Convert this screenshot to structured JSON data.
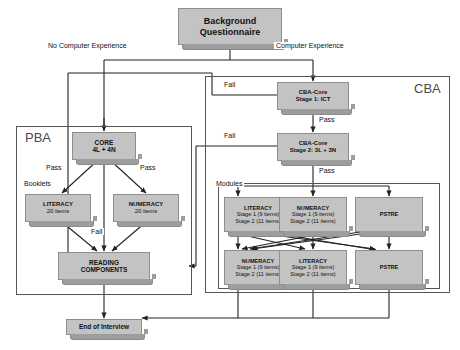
{
  "diagram": {
    "colors": {
      "node_fill": "#c3c3c3",
      "node_shadow": "#9d9d9d",
      "node_border": "#8e8e8e",
      "frame_border": "#555555",
      "line": "#222222",
      "text": "#111111",
      "frame_label_text": "#4a4a4a",
      "background": "#ffffff"
    },
    "frames": [
      {
        "id": "pba",
        "label": "PBA"
      },
      {
        "id": "cba",
        "label": "CBA"
      },
      {
        "id": "modules",
        "label": ""
      }
    ],
    "nodes": {
      "background_questionnaire": {
        "line1": "Background",
        "line2": "Questionnaire"
      },
      "cba_core_stage1": {
        "line1": "CBA-Core",
        "line2": "Stage 1: ICT"
      },
      "cba_core_stage2": {
        "line1": "CBA-Core",
        "line2": "Stage 2: 3L + 3N"
      },
      "pba_core": {
        "line1": "CORE",
        "line2": "4L + 4N"
      },
      "pba_literacy": {
        "line1": "LITERACY",
        "line2": "20 items"
      },
      "pba_numeracy": {
        "line1": "NUMERACY",
        "line2": "20 items"
      },
      "reading_components": {
        "line1": "READING",
        "line2": "COMPONENTS"
      },
      "mod_r1_literacy": {
        "line1": "LITERACY",
        "line2": "Stage 1 (9 items)",
        "line3": "Stage 2 (11 items)"
      },
      "mod_r1_numeracy": {
        "line1": "NUMERACY",
        "line2": "Stage 1 (9 items)",
        "line3": "Stage 2 (11 items)"
      },
      "mod_r1_pstre": {
        "line1": "PSTRE",
        "line2": "",
        "line3": ""
      },
      "mod_r2_numeracy": {
        "line1": "NUMERACY",
        "line2": "Stage 1 (9 items)",
        "line3": "Stage 2 (11 items)"
      },
      "mod_r2_literacy": {
        "line1": "LITERACY",
        "line2": "Stage 1 (9 items)",
        "line3": "Stage 2 (11 items)"
      },
      "mod_r2_pstre": {
        "line1": "PSTRE",
        "line2": "",
        "line3": ""
      },
      "end_of_interview": {
        "line1": "End of Interview"
      }
    },
    "edge_labels": {
      "no_computer_experience": "No Computer Experience",
      "computer_experience": "Computer Experience",
      "fail_stage1": "Fail",
      "fail_stage2": "Fail",
      "pass_stage1": "Pass",
      "pass_stage2": "Pass",
      "modules": "Modules",
      "pba_pass_left": "Pass",
      "pba_pass_right": "Pass",
      "booklets": "Booklets",
      "pba_fail": "Fail"
    }
  }
}
